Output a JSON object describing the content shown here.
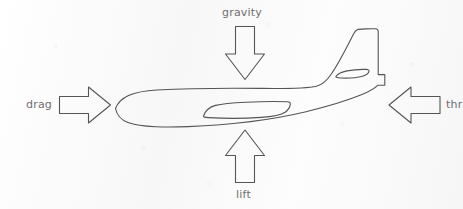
{
  "diagram": {
    "colors": {
      "background": "#fbfbfb",
      "stroke": "#555555",
      "label_text": "#6e6e6e"
    },
    "forces": [
      {
        "id": "gravity",
        "label": "gravity",
        "direction": "down",
        "arrow_icon": "arrow-down-icon"
      },
      {
        "id": "lift",
        "label": "lift",
        "direction": "up",
        "arrow_icon": "arrow-up-icon"
      },
      {
        "id": "drag",
        "label": "drag",
        "direction": "right",
        "arrow_icon": "arrow-right-icon"
      },
      {
        "id": "thrust",
        "label": "thr",
        "direction": "left",
        "arrow_icon": "arrow-left-icon"
      }
    ],
    "airplane": {
      "parts": [
        {
          "id": "fuselage",
          "label": "fuselage"
        },
        {
          "id": "vertical-stabilizer",
          "label": "vertical stabilizer"
        },
        {
          "id": "horizontal-stabilizer",
          "label": "horizontal stabilizer"
        },
        {
          "id": "wing",
          "label": "wing"
        },
        {
          "id": "tail-cone",
          "label": "tail cone"
        }
      ]
    }
  }
}
